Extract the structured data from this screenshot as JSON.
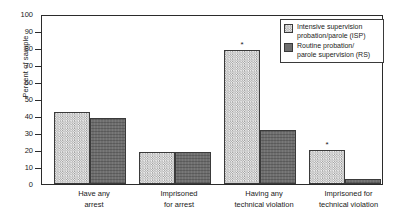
{
  "chart_data": {
    "type": "bar",
    "title": "",
    "xlabel": "",
    "ylabel": "Percent of sample",
    "ylim": [
      0,
      100
    ],
    "yticks": [
      0,
      10,
      20,
      30,
      40,
      50,
      60,
      70,
      80,
      90,
      100
    ],
    "grid": false,
    "legend_position": "top-right",
    "categories": [
      "Have any arrest",
      "Imprisoned for arrest",
      "Having any technical violation",
      "Imprisoned for technical violation"
    ],
    "category_lines": [
      {
        "line1": "Have any",
        "line2": "arrest"
      },
      {
        "line1": "Imprisoned",
        "line2": "for arrest"
      },
      {
        "line1": "Having any",
        "line2": "technical violation"
      },
      {
        "line1": "Imprisoned for",
        "line2": "technical violation"
      }
    ],
    "series": [
      {
        "name": "Intensive supervision probation/parole (ISP)",
        "key": "isp",
        "values": [
          43,
          19,
          80,
          20
        ],
        "annotations": [
          "",
          "",
          "*",
          "*"
        ]
      },
      {
        "name": "Routine probation/parole supervision (RS)",
        "key": "rs",
        "values": [
          39,
          19,
          32,
          3
        ],
        "annotations": [
          "",
          "",
          "",
          ""
        ]
      }
    ],
    "annotation_symbol": "*"
  },
  "legend": {
    "items": [
      {
        "swatch": "isp",
        "line1": "Intensive supervision",
        "line2": "probation/parole (ISP)"
      },
      {
        "swatch": "rs",
        "line1": "Routine probation/",
        "line2": "parole supervision (RS)"
      }
    ]
  },
  "axis": {
    "y_title": "Percent of sample",
    "y_tick_labels": [
      "100",
      "90",
      "80",
      "70",
      "60",
      "50",
      "40",
      "30",
      "20",
      "10",
      "0"
    ]
  }
}
